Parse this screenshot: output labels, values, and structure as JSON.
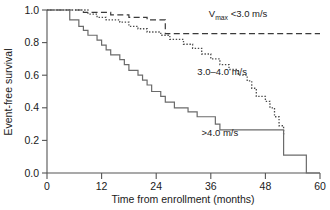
{
  "chart_data": {
    "type": "line",
    "subtype": "kaplan-meier-step",
    "title": "",
    "xlabel": "Time from enrollment (months)",
    "ylabel": "Event-free survival",
    "xlim": [
      0,
      60
    ],
    "ylim": [
      0.0,
      1.0
    ],
    "xticks": [
      0,
      12,
      24,
      36,
      48,
      60
    ],
    "xtick_labels": [
      "0",
      "12",
      "24",
      "36",
      "48",
      "60"
    ],
    "yticks": [
      0.0,
      0.2,
      0.4,
      0.6,
      0.8,
      1.0
    ],
    "ytick_labels": [
      "0.0",
      "0.2",
      "0.4",
      "0.6",
      "0.8",
      "1.0"
    ],
    "grid": false,
    "legend_position": "inline-annotations",
    "series": [
      {
        "name": "Vmax <3.0 m/s",
        "label_main": "V",
        "label_sub": "max",
        "label_rest": " <3.0 m/s",
        "style": "dashed",
        "color": "#3a3a3a",
        "label_x": 42.0,
        "label_y": 0.955,
        "points": [
          [
            0,
            1.0
          ],
          [
            8,
            1.0
          ],
          [
            8,
            0.985
          ],
          [
            14,
            0.985
          ],
          [
            14,
            0.97
          ],
          [
            18,
            0.97
          ],
          [
            18,
            0.955
          ],
          [
            22,
            0.955
          ],
          [
            22,
            0.94
          ],
          [
            26,
            0.94
          ],
          [
            26,
            0.855
          ],
          [
            60,
            0.855
          ]
        ]
      },
      {
        "name": "3.0-4.0 m/s",
        "label_main": "3.0–4.0 m/s",
        "style": "dotted",
        "color": "#4a4a4a",
        "label_x": 38.5,
        "label_y": 0.6,
        "points": [
          [
            0,
            1.0
          ],
          [
            9,
            1.0
          ],
          [
            9,
            0.975
          ],
          [
            11,
            0.975
          ],
          [
            11,
            0.955
          ],
          [
            13,
            0.955
          ],
          [
            13,
            0.94
          ],
          [
            16,
            0.94
          ],
          [
            16,
            0.925
          ],
          [
            18,
            0.925
          ],
          [
            18,
            0.9
          ],
          [
            20,
            0.9
          ],
          [
            20,
            0.885
          ],
          [
            22,
            0.885
          ],
          [
            22,
            0.865
          ],
          [
            25,
            0.865
          ],
          [
            25,
            0.845
          ],
          [
            27,
            0.845
          ],
          [
            27,
            0.82
          ],
          [
            30,
            0.82
          ],
          [
            30,
            0.79
          ],
          [
            32,
            0.79
          ],
          [
            32,
            0.765
          ],
          [
            34,
            0.765
          ],
          [
            34,
            0.73
          ],
          [
            36,
            0.73
          ],
          [
            36,
            0.7
          ],
          [
            38,
            0.7
          ],
          [
            38,
            0.665
          ],
          [
            40,
            0.665
          ],
          [
            40,
            0.635
          ],
          [
            42,
            0.635
          ],
          [
            42,
            0.6
          ],
          [
            44,
            0.6
          ],
          [
            44,
            0.565
          ],
          [
            45,
            0.565
          ],
          [
            45,
            0.52
          ],
          [
            46,
            0.52
          ],
          [
            46,
            0.47
          ],
          [
            48,
            0.47
          ],
          [
            48,
            0.44
          ],
          [
            49,
            0.44
          ],
          [
            49,
            0.4
          ],
          [
            50,
            0.4
          ],
          [
            50,
            0.345
          ],
          [
            51,
            0.345
          ],
          [
            51,
            0.29
          ],
          [
            52,
            0.29
          ],
          [
            52,
            0.23
          ]
        ]
      },
      {
        "name": ">4.0 m/s",
        "label_main": ">4.0 m/s",
        "style": "solid",
        "color": "#6b6b6b",
        "label_x": 38.0,
        "label_y": 0.225,
        "points": [
          [
            0,
            1.0
          ],
          [
            5,
            1.0
          ],
          [
            5,
            0.94
          ],
          [
            7,
            0.94
          ],
          [
            7,
            0.9
          ],
          [
            8,
            0.9
          ],
          [
            8,
            0.875
          ],
          [
            9,
            0.875
          ],
          [
            9,
            0.845
          ],
          [
            11,
            0.845
          ],
          [
            11,
            0.815
          ],
          [
            12,
            0.815
          ],
          [
            12,
            0.785
          ],
          [
            13,
            0.785
          ],
          [
            13,
            0.755
          ],
          [
            14,
            0.755
          ],
          [
            14,
            0.725
          ],
          [
            16,
            0.725
          ],
          [
            16,
            0.695
          ],
          [
            17,
            0.695
          ],
          [
            17,
            0.665
          ],
          [
            18,
            0.665
          ],
          [
            18,
            0.63
          ],
          [
            20,
            0.63
          ],
          [
            20,
            0.6
          ],
          [
            21,
            0.6
          ],
          [
            21,
            0.57
          ],
          [
            22,
            0.57
          ],
          [
            22,
            0.54
          ],
          [
            23,
            0.54
          ],
          [
            23,
            0.5
          ],
          [
            25,
            0.5
          ],
          [
            25,
            0.47
          ],
          [
            26,
            0.47
          ],
          [
            26,
            0.435
          ],
          [
            28,
            0.435
          ],
          [
            28,
            0.4
          ],
          [
            31,
            0.4
          ],
          [
            31,
            0.375
          ],
          [
            33,
            0.375
          ],
          [
            33,
            0.345
          ],
          [
            37,
            0.345
          ],
          [
            37,
            0.3
          ],
          [
            38,
            0.3
          ],
          [
            38,
            0.265
          ],
          [
            52,
            0.265
          ],
          [
            52,
            0.11
          ],
          [
            57,
            0.11
          ],
          [
            57,
            0.0
          ],
          [
            60,
            0.0
          ]
        ]
      }
    ]
  },
  "axes": {
    "x_title": "Time from enrollment (months)",
    "y_title": "Event-free survival"
  }
}
